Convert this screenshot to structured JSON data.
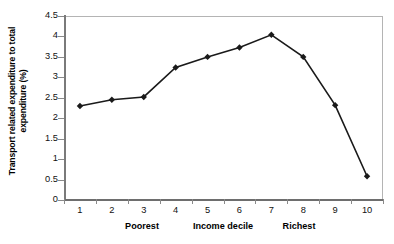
{
  "chart_data": {
    "type": "line",
    "title": "",
    "xlabel": "Income decile",
    "ylabel": "Transport related expenditure to total expenditure (%)",
    "categories": [
      "1",
      "2",
      "3",
      "4",
      "5",
      "6",
      "7",
      "8",
      "9",
      "10"
    ],
    "values": [
      2.3,
      2.45,
      2.52,
      3.24,
      3.5,
      3.73,
      4.04,
      3.5,
      2.32,
      0.58
    ],
    "series": [
      {
        "name": "Transport related expenditure to total expenditure (%)",
        "values": [
          2.3,
          2.45,
          2.52,
          3.24,
          3.5,
          3.73,
          4.04,
          3.5,
          2.32,
          0.58
        ]
      }
    ],
    "ylim": [
      0,
      4.5
    ],
    "ytick_labels": [
      "0",
      "0.5",
      "1",
      "1.5",
      "2",
      "2.5",
      "3",
      "3.5",
      "4",
      "4.5"
    ],
    "ytick_values": [
      0,
      0.5,
      1,
      1.5,
      2,
      2.5,
      3,
      3.5,
      4,
      4.5
    ],
    "grid": false,
    "legend": "none",
    "marker": "diamond",
    "line_color": "#1a1a1a",
    "marker_color": "#1a1a1a",
    "axis_color": "#808080",
    "background": "#ffffff"
  },
  "axis_captions": {
    "poorest": "Poorest",
    "income_decile": "Income decile",
    "richest": "Richest"
  }
}
